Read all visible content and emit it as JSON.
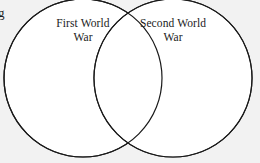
{
  "diagram": {
    "type": "venn",
    "background_color": "#f2f2f2",
    "circle_fill_color": "#ffffff",
    "stroke_color": "#1a1a1a",
    "sets": [
      {
        "id": "left",
        "label": "First World\nWar",
        "label_line_1": "First World",
        "label_line_2": "War",
        "center_x": 83,
        "center_y": 78,
        "radius": 79
      },
      {
        "id": "right",
        "label": "Second World\nWar",
        "label_line_1": "Second World",
        "label_line_2": "War",
        "center_x": 173,
        "center_y": 78,
        "radius": 79
      }
    ]
  },
  "margin_text": {
    "cropped_glyph": "g"
  }
}
